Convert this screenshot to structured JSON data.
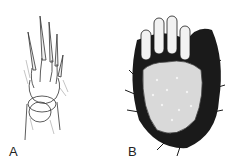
{
  "figure": {
    "panels": [
      {
        "id": "A",
        "label": "A",
        "description": "line drawing of a slender paw with long claws, ventral view"
      },
      {
        "id": "B",
        "label": "B",
        "description": "dark furred paw with large granular pad and four clawed toes"
      }
    ],
    "colors": {
      "background": "#ffffff",
      "ink": "#1a1a1a",
      "pad": "#d9d9d9"
    }
  }
}
